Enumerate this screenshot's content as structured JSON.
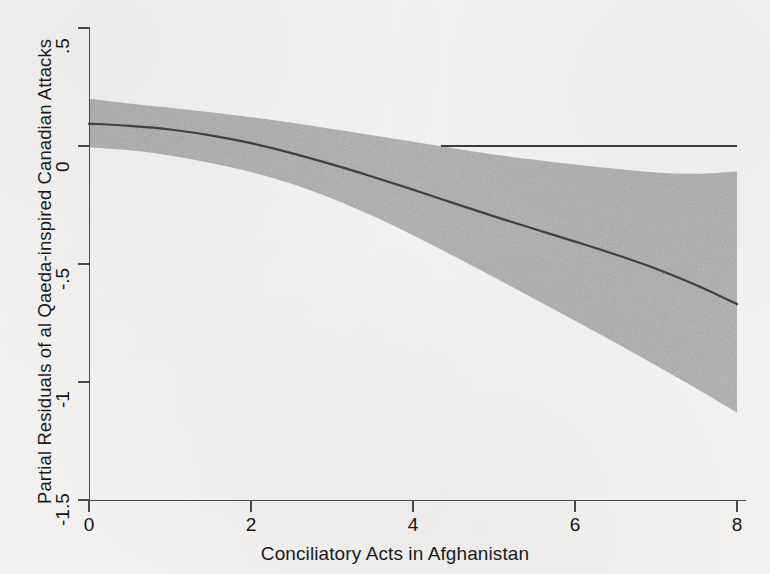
{
  "figure": {
    "kind": "statistical-marginal-effects-plot",
    "background_color": "#f3f2f0",
    "line_color": "#3d3d44",
    "band_color": "#b9b9b9",
    "axis_color": "#4a4a4a"
  },
  "chart_data": {
    "type": "line",
    "title": "",
    "subtitle": "",
    "xlabel": "Conciliatory Acts in Afghanistan",
    "ylabel": "Partial Residuals of al Qaeda-inspired Canadian Attacks",
    "xlim": [
      0,
      8
    ],
    "ylim": [
      -1.5,
      0.5
    ],
    "xticks": [
      0,
      2,
      4,
      6,
      8
    ],
    "xtick_labels": [
      "0",
      "2",
      "4",
      "6",
      "8"
    ],
    "yticks": [
      0.5,
      0,
      -0.5,
      -1,
      -1.5
    ],
    "ytick_labels": [
      ".5",
      "0",
      "-.5",
      "-1",
      "-1.5"
    ],
    "grid": false,
    "legend": null,
    "legend_position": "none",
    "annotations": [
      {
        "name": "zero-reference-line",
        "type": "horizontal-line",
        "y": 0,
        "x_start": 4.35,
        "x_end": 8
      }
    ],
    "x": [
      0,
      0.5,
      1,
      1.5,
      2,
      2.5,
      3,
      3.5,
      4,
      4.5,
      5,
      5.5,
      6,
      6.5,
      7,
      7.5,
      8
    ],
    "series": [
      {
        "name": "Partial residual fit",
        "role": "fitted-line",
        "values": [
          0.095,
          0.085,
          0.07,
          0.045,
          0.012,
          -0.03,
          -0.078,
          -0.13,
          -0.185,
          -0.242,
          -0.298,
          -0.352,
          -0.405,
          -0.46,
          -0.52,
          -0.59,
          -0.67
        ]
      },
      {
        "name": "95% confidence interval upper",
        "role": "ci-upper",
        "values": [
          0.2,
          0.18,
          0.162,
          0.143,
          0.122,
          0.098,
          0.072,
          0.046,
          0.018,
          -0.01,
          -0.036,
          -0.058,
          -0.078,
          -0.096,
          -0.112,
          -0.118,
          -0.108
        ]
      },
      {
        "name": "95% confidence interval lower",
        "role": "ci-lower",
        "values": [
          -0.005,
          -0.018,
          -0.04,
          -0.072,
          -0.11,
          -0.16,
          -0.222,
          -0.296,
          -0.378,
          -0.466,
          -0.556,
          -0.648,
          -0.74,
          -0.834,
          -0.93,
          -1.028,
          -1.13
        ]
      }
    ]
  }
}
